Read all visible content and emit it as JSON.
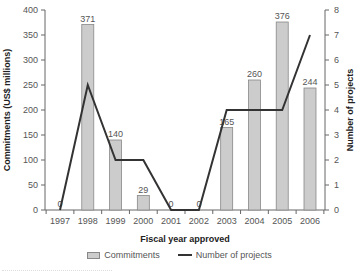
{
  "chart_data": {
    "type": "bar",
    "categories": [
      "1997",
      "1998",
      "1999",
      "2000",
      "2001",
      "2002",
      "2003",
      "2004",
      "2005",
      "2006"
    ],
    "series": [
      {
        "name": "Commitments",
        "type": "bar",
        "axis": "left",
        "values": [
          0,
          371,
          140,
          29,
          0,
          0,
          165,
          260,
          376,
          244
        ],
        "color": "#cccccc"
      },
      {
        "name": "Number of projects",
        "type": "line",
        "axis": "right",
        "values": [
          0,
          5,
          2,
          2,
          0,
          0,
          4,
          4,
          4,
          7
        ],
        "color": "#333333"
      }
    ],
    "title": "",
    "xlabel": "Fiscal year approved",
    "ylabel": "Commitments (US$ millions)",
    "y2label": "Number of projects",
    "ylim": [
      0,
      400
    ],
    "y2lim": [
      0,
      8
    ],
    "yticks": [
      0,
      50,
      100,
      150,
      200,
      250,
      300,
      350,
      400
    ],
    "y2ticks": [
      0,
      1,
      2,
      3,
      4,
      5,
      6,
      7,
      8
    ],
    "grid": false,
    "legend_position": "bottom"
  },
  "legend": {
    "commitments": "Commitments",
    "projects": "Number of projects"
  }
}
